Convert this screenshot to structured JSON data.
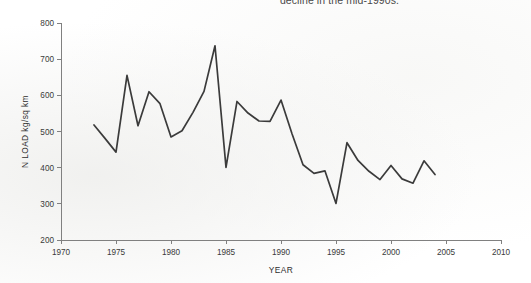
{
  "caption": {
    "text": "decline in the mid-1990s."
  },
  "colors": {
    "line": "#3b3b3b",
    "axis": "#808080",
    "text": "#3a3a3a",
    "background": "#ffffff"
  },
  "chart_data": {
    "type": "line",
    "title": "",
    "xlabel": "YEAR",
    "ylabel": "N LOAD kg/sq km",
    "xlim": [
      1970,
      2010
    ],
    "ylim": [
      200,
      800
    ],
    "xticks": [
      1970,
      1975,
      1980,
      1985,
      1990,
      1995,
      2000,
      2005,
      2010
    ],
    "yticks": [
      200,
      300,
      400,
      500,
      600,
      700,
      800
    ],
    "grid": false,
    "legend": null,
    "series": [
      {
        "name": "N LOAD",
        "x": [
          1973,
          1974,
          1975,
          1976,
          1977,
          1978,
          1979,
          1980,
          1981,
          1982,
          1983,
          1984,
          1985,
          1986,
          1987,
          1988,
          1989,
          1990,
          1991,
          1992,
          1993,
          1994,
          1995,
          1996,
          1997,
          1998,
          1999,
          2000,
          2001,
          2002,
          2003,
          2004
        ],
        "values": [
          518,
          481,
          443,
          655,
          516,
          610,
          577,
          485,
          502,
          553,
          611,
          737,
          401,
          583,
          551,
          529,
          528,
          587,
          494,
          408,
          384,
          391,
          301,
          469,
          420,
          390,
          367,
          406,
          369,
          357,
          419,
          381
        ]
      }
    ]
  }
}
